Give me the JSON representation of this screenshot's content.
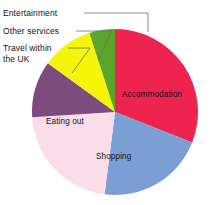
{
  "chart_data": {
    "type": "pie",
    "title": "",
    "subtitle": "",
    "xlabel": "",
    "ylabel": "",
    "legend_position": "none",
    "grid": false,
    "labels_shown": true,
    "categories": [
      "Accommodation",
      "Shopping",
      "Eating out",
      "Travel within the UK",
      "Other services",
      "Entertainment"
    ],
    "values": [
      31,
      21,
      22,
      11,
      10,
      5
    ],
    "units": "percent",
    "slices": [
      {
        "name": "accommodation",
        "label": "Accommodation",
        "value": 31,
        "color": "#ee2450",
        "start_angle": 0,
        "end_angle": 111.6,
        "label_placement": "inside"
      },
      {
        "name": "shopping",
        "label": "Shopping",
        "value": 21,
        "color": "#7b9fd4",
        "start_angle": 111.6,
        "end_angle": 187.2,
        "label_placement": "inside"
      },
      {
        "name": "eating-out",
        "label": "Eating out",
        "value": 22,
        "color": "#f9dde8",
        "start_angle": 187.2,
        "end_angle": 266.4,
        "label_placement": "inside"
      },
      {
        "name": "travel-within-the-uk",
        "label": "Travel within\nthe UK",
        "value": 11,
        "color": "#7e4b7e",
        "start_angle": 266.4,
        "end_angle": 306.0,
        "label_placement": "leader"
      },
      {
        "name": "other-services",
        "label": "Other services",
        "value": 10,
        "color": "#f5f50a",
        "start_angle": 306.0,
        "end_angle": 342.0,
        "label_placement": "leader"
      },
      {
        "name": "entertainment",
        "label": "Entertainment",
        "value": 5,
        "color": "#5aa52a",
        "start_angle": 342.0,
        "end_angle": 360.0,
        "label_placement": "leader"
      }
    ],
    "geometry": {
      "center_x": 115,
      "center_y": 112,
      "radius": 83
    },
    "colors": {
      "accommodation": "#ee2450",
      "shopping": "#7b9fd4",
      "eating_out": "#f9dde8",
      "travel_within_uk": "#7e4b7e",
      "other_services": "#f5f50a",
      "entertainment": "#5aa52a",
      "background": "#ffffff",
      "text": "#131313",
      "leader_line": "#6f6f6f"
    }
  },
  "labels": {
    "entertainment": "Entertainment",
    "other_services": "Other services",
    "travel_uk_line1": "Travel within",
    "travel_uk_line2": "the UK",
    "accommodation": "Accommodation",
    "shopping": "Shopping",
    "eating_out": "Eating out"
  }
}
